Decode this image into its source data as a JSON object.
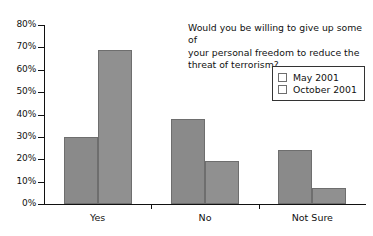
{
  "chart_data": {
    "type": "bar",
    "title": "Would you be willing to give up some of your personal freedom to reduce the threat of terrorism?",
    "title_lines": [
      "Would you be willing to give up some of",
      "your personal freedom to reduce the",
      "threat of terrorism?"
    ],
    "categories": [
      "Yes",
      "No",
      "Not Sure"
    ],
    "series": [
      {
        "name": "May 2001",
        "values": [
          30,
          38,
          24
        ],
        "color": "#8a8a8a"
      },
      {
        "name": "October 2001",
        "values": [
          69,
          19,
          7
        ],
        "color": "#909090"
      }
    ],
    "xlabel": "",
    "ylabel": "",
    "ylim": [
      0,
      80
    ],
    "ytick_labels": [
      "0%",
      "10%",
      "20%",
      "30%",
      "40%",
      "50%",
      "60%",
      "70%",
      "80%"
    ],
    "ytick_values": [
      0,
      10,
      20,
      30,
      40,
      50,
      60,
      70,
      80
    ],
    "grid": false,
    "legend_position": "top-right",
    "value_suffix": "%"
  }
}
